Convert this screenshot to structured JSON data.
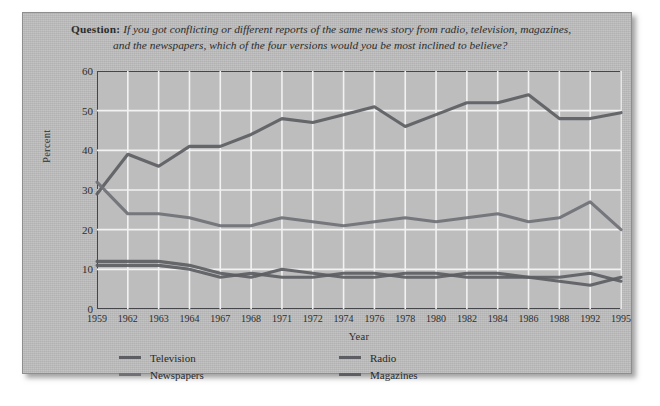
{
  "question": {
    "label": "Question:",
    "line1": "If you got conflicting or different reports of the same news story from radio, television, magazines,",
    "line2": "and the newspapers, which of the four versions would you be most inclined to believe?"
  },
  "legend": [
    {
      "name": "Television",
      "color": "#5c5e63"
    },
    {
      "name": "Radio",
      "color": "#5c5e63"
    },
    {
      "name": "Newspapers",
      "color": "#6f7176"
    },
    {
      "name": "Magazines",
      "color": "#5c5e63"
    }
  ],
  "chart_data": {
    "type": "line",
    "title": "",
    "xlabel": "Year",
    "ylabel": "Percent",
    "ylim": [
      0,
      60
    ],
    "yticks": [
      0,
      10,
      20,
      30,
      40,
      50,
      60
    ],
    "grid": true,
    "legend_position": "bottom",
    "categories": [
      "1959",
      "1962",
      "1963",
      "1964",
      "1967",
      "1968",
      "1971",
      "1972",
      "1974",
      "1976",
      "1978",
      "1980",
      "1982",
      "1984",
      "1986",
      "1988",
      "1992",
      "1995"
    ],
    "series": [
      {
        "name": "Television",
        "color": "#5c5e63",
        "values": [
          29,
          39,
          36,
          41,
          41,
          44,
          48,
          47,
          49,
          51,
          46,
          49,
          52,
          52,
          54,
          48,
          48,
          49.5
        ]
      },
      {
        "name": "Newspapers",
        "color": "#6f7176",
        "values": [
          32,
          24,
          24,
          23,
          21,
          21,
          23,
          22,
          21,
          22,
          23,
          22,
          23,
          24,
          22,
          23,
          27,
          20
        ]
      },
      {
        "name": "Radio",
        "color": "#5c5e63",
        "values": [
          12,
          12,
          12,
          11,
          9,
          8,
          10,
          9,
          8,
          8,
          9,
          9,
          8,
          8,
          8,
          7,
          6,
          8
        ]
      },
      {
        "name": "Magazines",
        "color": "#5c5e63",
        "values": [
          11,
          11,
          11,
          10,
          8,
          9,
          8,
          8,
          9,
          9,
          8,
          8,
          9,
          9,
          8,
          8,
          9,
          7
        ]
      }
    ]
  }
}
